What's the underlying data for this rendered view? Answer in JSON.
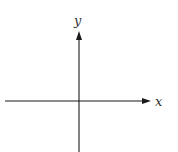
{
  "diagram": {
    "type": "coordinate-axes",
    "x_axis_label": "x",
    "y_axis_label": "y",
    "line_color": "#1a1a1a"
  }
}
